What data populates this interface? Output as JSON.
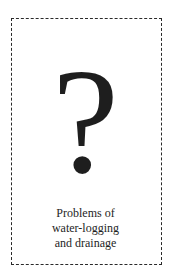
{
  "card": {
    "symbol": "?",
    "caption_lines": [
      "Problems of",
      "water-logging",
      "and drainage"
    ]
  }
}
